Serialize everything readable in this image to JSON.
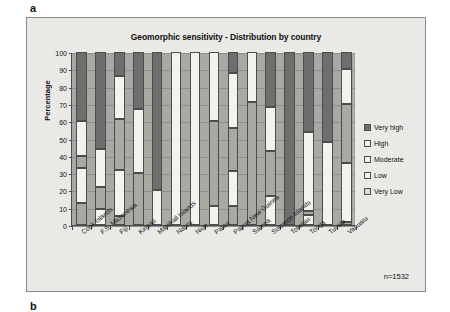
{
  "figure": {
    "panel_a_label": "a",
    "panel_b_label": "b",
    "sample_note": "n=1532",
    "background_color": "#e9e9e6",
    "plot_background_color": "#a9a9a4"
  },
  "chart_data": {
    "type": "bar",
    "subtype": "stacked-percentage",
    "title": "Geomorphic sensitivity - Distribution by country",
    "xlabel": "",
    "ylabel": "Percentage",
    "ylim": [
      0,
      100
    ],
    "yticks": [
      0,
      10,
      20,
      30,
      40,
      50,
      60,
      70,
      80,
      90,
      100
    ],
    "grid": true,
    "legend_position": "right",
    "annotation": "n=1532",
    "categories": [
      "Cook Islands",
      "F.S. Micronesia",
      "Fiji",
      "Kiribati",
      "Marshall Islands",
      "Nauru",
      "Niue",
      "Palau",
      "Papua New Guinea",
      "Samoa",
      "Solomon Islands",
      "Tokelau",
      "Tonga",
      "Tuvalu",
      "Vanuatu"
    ],
    "series": [
      {
        "name": "Very high",
        "color": "#6e6e6e",
        "values": [
          40,
          56,
          14,
          33,
          80,
          0,
          0,
          0,
          12,
          0,
          32,
          100,
          46,
          52,
          10
        ]
      },
      {
        "name": "High",
        "color": "#f2f2ee",
        "values": [
          20,
          22,
          25,
          37,
          20,
          100,
          100,
          40,
          32,
          29,
          25,
          0,
          46,
          48,
          20
        ]
      },
      {
        "name": "Moderate",
        "color": "#a9a9a4",
        "values": [
          7,
          13,
          29,
          30,
          0,
          0,
          0,
          49,
          25,
          71,
          26,
          0,
          2,
          0,
          34
        ]
      },
      {
        "name": "Low",
        "color": "#f2f2ee",
        "values": [
          20,
          9,
          27,
          0,
          0,
          0,
          0,
          11,
          20,
          0,
          17,
          0,
          6,
          0,
          34
        ]
      },
      {
        "name": "Very Low",
        "color": "#a9a9a4",
        "values": [
          13,
          0,
          5,
          0,
          0,
          0,
          0,
          0,
          11,
          0,
          0,
          0,
          0,
          0,
          2
        ]
      }
    ],
    "legend": [
      {
        "label": "Very high",
        "color": "#6e6e6e"
      },
      {
        "label": "High",
        "color": "#f2f2ee"
      },
      {
        "label": "Moderate",
        "color": "#f2f2ee"
      },
      {
        "label": "Low",
        "color": "#f2f2ee"
      },
      {
        "label": "Very Low",
        "color": "#d8d8d4"
      }
    ]
  }
}
